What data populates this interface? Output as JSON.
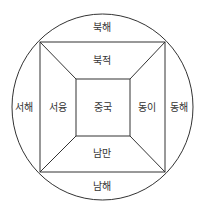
{
  "diagram": {
    "title": "",
    "line_color": "#333333",
    "regions": {
      "north_sea": "북해",
      "north_barbarians": "북적",
      "west_sea": "서해",
      "west_barbarians": "서융",
      "center": "중국",
      "east_barbarians": "동이",
      "east_sea": "동해",
      "south_barbarians": "남만",
      "south_sea": "남해"
    }
  }
}
